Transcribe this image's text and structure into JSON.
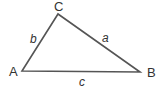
{
  "diagram": {
    "type": "triangle",
    "stroke_color": "#555555",
    "vertices": [
      {
        "id": "A",
        "label": "A",
        "x": 22,
        "y": 71,
        "label_x": 9,
        "label_y": 76
      },
      {
        "id": "B",
        "label": "B",
        "x": 140,
        "y": 72,
        "label_x": 147,
        "label_y": 77
      },
      {
        "id": "C",
        "label": "C",
        "x": 58,
        "y": 14,
        "label_x": 54,
        "label_y": 11
      }
    ],
    "sides": [
      {
        "id": "a",
        "label": "a",
        "from": "C",
        "to": "B",
        "label_x": 102,
        "label_y": 42
      },
      {
        "id": "b",
        "label": "b",
        "from": "A",
        "to": "C",
        "label_x": 30,
        "label_y": 43
      },
      {
        "id": "c",
        "label": "c",
        "from": "A",
        "to": "B",
        "label_x": 79,
        "label_y": 86
      }
    ]
  }
}
